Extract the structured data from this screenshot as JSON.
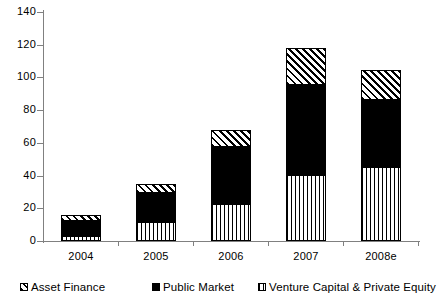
{
  "chart_data": {
    "type": "bar",
    "subtype": "stacked-vertical",
    "title": "",
    "subtitle": "",
    "xlabel": "",
    "ylabel": "",
    "categories": [
      "2004",
      "2005",
      "2006",
      "2007",
      "2008e"
    ],
    "series": [
      {
        "name": "Venture Capital & Private Equity",
        "pattern": "vertical-stripes",
        "values": [
          3,
          11.5,
          22.5,
          40.5,
          45
        ]
      },
      {
        "name": "Public Market",
        "pattern": "solid-black",
        "values": [
          9,
          18,
          35,
          55,
          41.5
        ]
      },
      {
        "name": "Asset Finance",
        "pattern": "diagonal-hatch",
        "values": [
          4,
          5.5,
          10.5,
          22.5,
          18
        ]
      }
    ],
    "totals": [
      16,
      35,
      68,
      118,
      104.5
    ],
    "ylim": [
      0,
      140
    ],
    "ytick_step": 20,
    "ytick_labels": [
      "0",
      "20",
      "40",
      "60",
      "80",
      "100",
      "120",
      "140"
    ],
    "grid": false,
    "legend_position": "bottom",
    "legend_order": [
      "Asset Finance",
      "Public Market",
      "Venture Capital & Private Equity"
    ],
    "axis_color": "#808080",
    "bar_border_color": "#000000",
    "background_color": "#ffffff"
  },
  "legend": {
    "items": [
      {
        "label": "Asset Finance",
        "pattern": "diagonal-hatch"
      },
      {
        "label": "Public Market",
        "pattern": "solid-black"
      },
      {
        "label": "Venture Capital & Private Equity",
        "pattern": "vertical-stripes"
      }
    ]
  }
}
